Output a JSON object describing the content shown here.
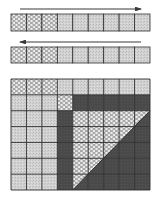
{
  "colors": {
    "background": "#ffffff",
    "light": "#cfcfcf",
    "bubble": "#bdbdbd",
    "dark": "#4a4a4a",
    "grid_line": "#2e2e2e",
    "arrow": "#3a3a3a"
  },
  "bars": [
    {
      "name": "top-bar",
      "arrow": {
        "direction": "right",
        "x1": 20,
        "x2": 141,
        "y": 9
      },
      "y": 14,
      "height": 17,
      "cells": [
        "bubble",
        "bubble",
        "bubble",
        "light",
        "light",
        "light",
        "light",
        "light",
        "light"
      ]
    },
    {
      "name": "middle-bar",
      "arrow": {
        "direction": "left",
        "x1": 20,
        "x2": 141,
        "y": 42
      },
      "y": 47,
      "height": 16,
      "cells": [
        "bubble",
        "bubble",
        "bubble",
        "light",
        "light",
        "light",
        "light",
        "light",
        "light"
      ]
    }
  ],
  "grid": {
    "x": 11,
    "y": 79,
    "width": 139,
    "height": 111,
    "cols": 9,
    "rows": 7,
    "cells": [
      [
        "bubble",
        "bubble",
        "bubble",
        "light",
        "light",
        "light",
        "light",
        "light",
        "light"
      ],
      [
        "light",
        "light",
        "light",
        "bubble",
        "dark",
        "dark",
        "dark",
        "dark",
        "dark"
      ],
      [
        "light",
        "light",
        "light",
        "dark",
        "dark",
        "dark",
        "dark",
        "dark",
        "dark"
      ],
      [
        "light",
        "light",
        "light",
        "dark",
        "dark",
        "dark",
        "dark",
        "dark",
        "dark"
      ],
      [
        "light",
        "light",
        "light",
        "dark",
        "dark",
        "dark",
        "dark",
        "dark",
        "dark"
      ],
      [
        "light",
        "light",
        "light",
        "dark",
        "dark",
        "dark",
        "dark",
        "dark",
        "dark"
      ],
      [
        "light",
        "light",
        "light",
        "dark",
        "dark",
        "dark",
        "dark",
        "dark",
        "dark"
      ]
    ],
    "triangle": {
      "points": [
        [
          4,
          2
        ],
        [
          9,
          2
        ],
        [
          4,
          7
        ]
      ],
      "pattern": "bubble"
    }
  },
  "bar_x": 11,
  "bar_width": 139,
  "bar_cols": 9
}
